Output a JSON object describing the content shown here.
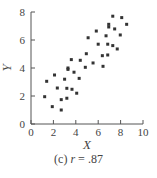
{
  "chart_data": {
    "type": "scatter",
    "title": "",
    "caption_prefix": "(c)",
    "caption_var": "r",
    "caption_value": "= .87",
    "xlabel": "X",
    "ylabel": "Y",
    "xlim": [
      0,
      10
    ],
    "ylim": [
      0,
      8
    ],
    "xticks": [
      0,
      2,
      4,
      6,
      8,
      10
    ],
    "yticks": [
      0,
      2,
      4,
      6,
      8
    ],
    "grid": false,
    "legend": null,
    "marker_color": "#333333",
    "points": [
      [
        1.22,
        1.95
      ],
      [
        1.4,
        3.05
      ],
      [
        1.9,
        1.24
      ],
      [
        2.1,
        3.5
      ],
      [
        2.35,
        2.57
      ],
      [
        2.7,
        1.74
      ],
      [
        2.7,
        1.0
      ],
      [
        3.0,
        3.2
      ],
      [
        3.2,
        2.55
      ],
      [
        3.2,
        1.84
      ],
      [
        3.3,
        3.9
      ],
      [
        3.3,
        4.0
      ],
      [
        3.6,
        4.6
      ],
      [
        3.66,
        2.48
      ],
      [
        3.84,
        3.7
      ],
      [
        4.08,
        2.2
      ],
      [
        4.3,
        3.26
      ],
      [
        4.4,
        4.55
      ],
      [
        4.85,
        4.05
      ],
      [
        4.94,
        5.02
      ],
      [
        5.1,
        6.16
      ],
      [
        5.54,
        4.36
      ],
      [
        5.83,
        6.64
      ],
      [
        6.0,
        5.7
      ],
      [
        6.37,
        4.88
      ],
      [
        6.43,
        4.12
      ],
      [
        6.7,
        6.3
      ],
      [
        6.85,
        5.7
      ],
      [
        6.85,
        4.93
      ],
      [
        6.94,
        7.12
      ],
      [
        6.94,
        6.93
      ],
      [
        7.3,
        7.7
      ],
      [
        7.3,
        5.6
      ],
      [
        7.47,
        6.79
      ],
      [
        7.7,
        5.36
      ],
      [
        7.97,
        6.36
      ],
      [
        8.1,
        7.6
      ],
      [
        8.54,
        7.12
      ]
    ]
  }
}
